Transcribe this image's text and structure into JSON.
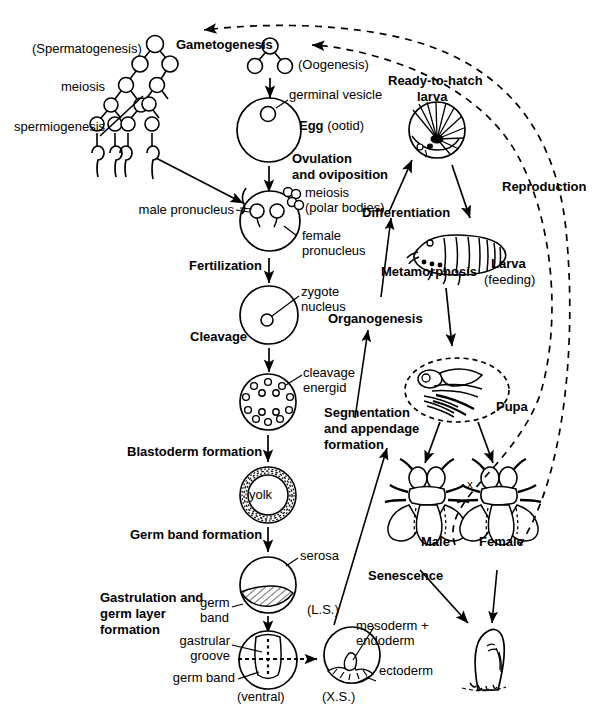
{
  "diagram": {
    "type": "life-cycle-flow-diagram",
    "ink_color": "#000000",
    "background_color": "#ffffff"
  },
  "labels": {
    "spermatogenesis": "(Spermatogenesis)",
    "gametogenesis": "Gametogenesis",
    "oogenesis": "(Oogenesis)",
    "meiosis": "meiosis",
    "spermiogenesis": "spermiogenesis",
    "germinal_vesicle": "germinal vesicle",
    "egg_bold": "Egg",
    "egg_paren": "(ootid)",
    "ovulation": "Ovulation",
    "oviposition": "and oviposition",
    "meiosis2": "meiosis",
    "polar_bodies": "(polar bodies)",
    "male_pronucleus": "male pronucleus",
    "female_pronucleus_1": "female",
    "female_pronucleus_2": "pronucleus",
    "fertilization": "Fertilization",
    "zygote": "zygote",
    "nucleus": "nucleus",
    "cleavage": "Cleavage",
    "cleavage_energid_1": "cleavage",
    "cleavage_energid_2": "energid",
    "blastoderm_formation": "Blastoderm formation",
    "yolk": "yolk",
    "germ_band_formation": "Germ band formation",
    "serosa": "serosa",
    "germ_1": "germ",
    "band_1": "band",
    "ls": "(L.S.)",
    "gastrulation_1": "Gastrulation and",
    "gastrulation_2": "germ layer",
    "gastrulation_3": "formation",
    "gastrular": "gastrular",
    "groove": "groove",
    "germ_band_2": "germ band",
    "ventral": "(ventral)",
    "xs": "(X.S.)",
    "mesoderm": "mesoderm +",
    "endoderm": "endoderm",
    "ectoderm": "ectoderm",
    "segmentation_1": "Segmentation",
    "segmentation_2": "and appendage",
    "segmentation_3": "formation",
    "organogenesis": "Organogenesis",
    "metamorphosis": "Metamorphosis",
    "differentiation": "Differentiation",
    "ready_larva_1": "Ready-to-hatch",
    "ready_larva_2": "larva",
    "larva": "Larva",
    "larva_feeding": "(feeding)",
    "pupa": "Pupa",
    "male": "Male",
    "female": "Female",
    "mating_cross": "x",
    "senescence": "Senescence",
    "reproduction": "Reproduction"
  },
  "stages": [
    {
      "name": "gametogenesis",
      "label": "Gametogenesis"
    },
    {
      "name": "egg",
      "label": "Egg (ootid)"
    },
    {
      "name": "fertilization",
      "label": "Fertilization"
    },
    {
      "name": "cleavage",
      "label": "Cleavage"
    },
    {
      "name": "blastoderm",
      "label": "Blastoderm formation"
    },
    {
      "name": "germ-band",
      "label": "Germ band formation"
    },
    {
      "name": "gastrulation",
      "label": "Gastrulation and germ layer formation"
    },
    {
      "name": "segmentation",
      "label": "Segmentation and appendage formation"
    },
    {
      "name": "organogenesis",
      "label": "Organogenesis"
    },
    {
      "name": "differentiation",
      "label": "Differentiation"
    },
    {
      "name": "ready-to-hatch-larva",
      "label": "Ready-to-hatch larva"
    },
    {
      "name": "larva",
      "label": "Larva (feeding)"
    },
    {
      "name": "metamorphosis",
      "label": "Metamorphosis"
    },
    {
      "name": "pupa",
      "label": "Pupa"
    },
    {
      "name": "adults",
      "label": "Male / Female"
    },
    {
      "name": "reproduction",
      "label": "Reproduction"
    },
    {
      "name": "senescence",
      "label": "Senescence"
    }
  ]
}
